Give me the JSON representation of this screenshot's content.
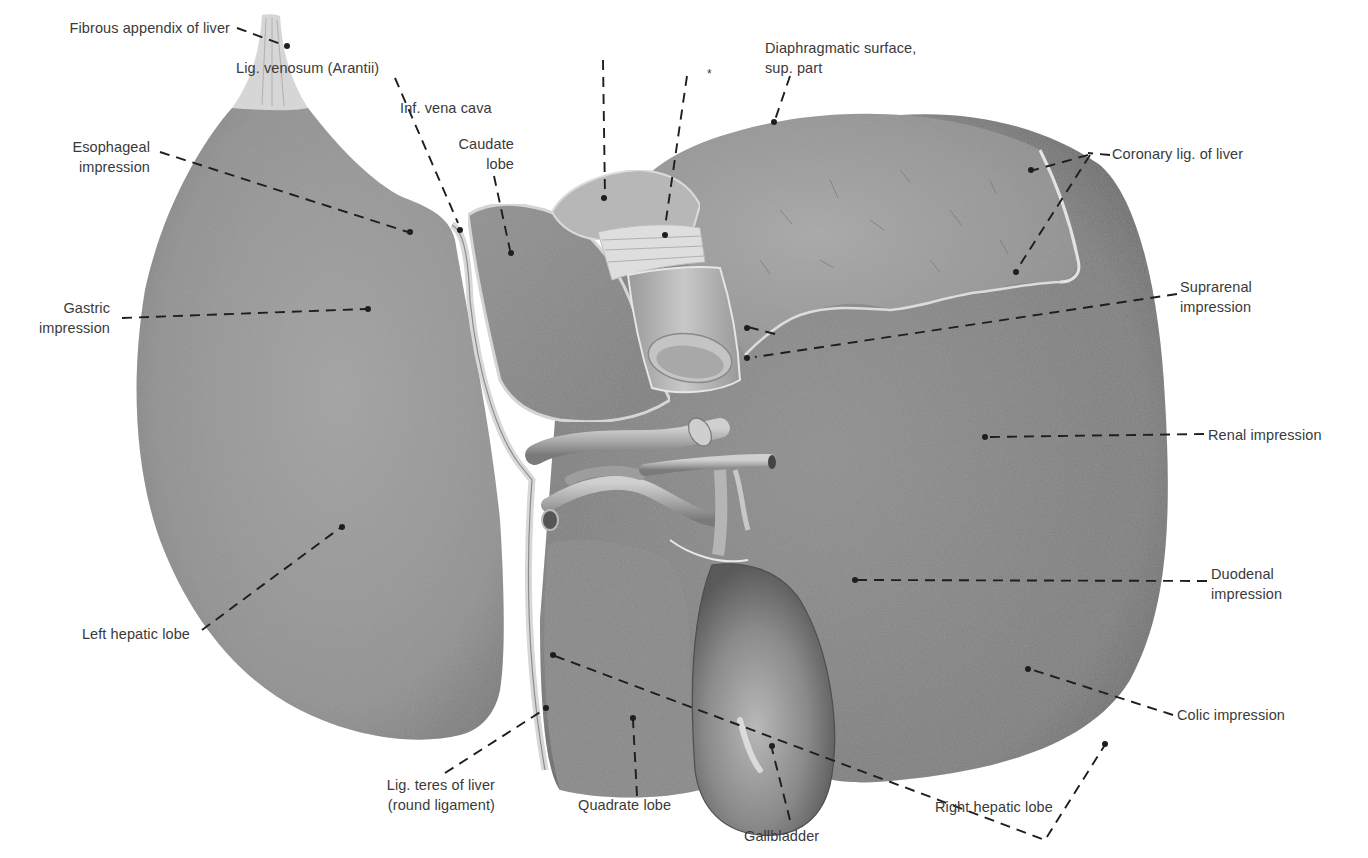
{
  "figure": {
    "colors": {
      "background": "#ffffff",
      "liver_mid": "#8a8a8a",
      "liver_dark": "#5e5e5e",
      "liver_light": "#b5b5b5",
      "label_text": "#3a3a3a",
      "leader_line": "#1e1e1e"
    }
  },
  "labels": {
    "fibrous_appendix": "Fibrous appendix of liver",
    "lig_venosum": "Lig. venosum (Arantii)",
    "inf_vena_cava": "Inf. vena cava",
    "asterisk": "*",
    "diaphragmatic_surface": "Diaphragmatic surface,\nsup. part",
    "esophageal_impression": "Esophageal\nimpression",
    "caudate_lobe": "Caudate\nlobe",
    "coronary_lig": "Coronary lig. of liver",
    "gastric_impression": "Gastric\nimpression",
    "suprarenal_impression": "Suprarenal\nimpression",
    "renal_impression": "Renal impression",
    "duodenal_impression": "Duodenal\nimpression",
    "left_hepatic_lobe": "Left hepatic lobe",
    "colic_impression": "Colic impression",
    "lig_teres": "Lig. teres of liver\n(round ligament)",
    "quadrate_lobe": "Quadrate lobe",
    "right_hepatic_lobe": "Right hepatic lobe",
    "gallbladder": "Gallbladder"
  }
}
